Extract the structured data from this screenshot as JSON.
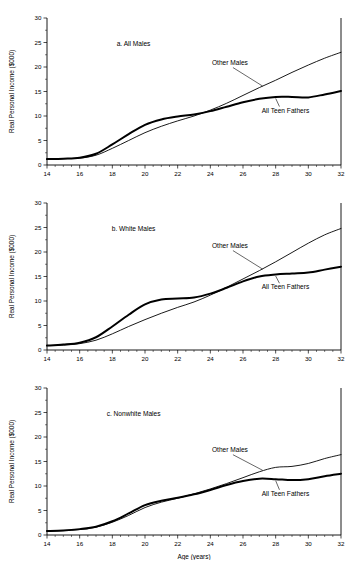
{
  "figure": {
    "xlabel": "Age (years)",
    "ylabel": "Real Personal Income ($000)",
    "x_ticks": [
      "14",
      "16",
      "18",
      "20",
      "22",
      "24",
      "26",
      "28",
      "30",
      "32"
    ],
    "y_ticks": [
      "0",
      "5",
      "10",
      "15",
      "20",
      "25",
      "30"
    ],
    "line_color": "#000000",
    "background": "#ffffff"
  },
  "chart_data": [
    {
      "type": "line",
      "panel_id": "a",
      "title": "a. All Males",
      "xlabel": "",
      "ylabel": "Real Personal Income ($000)",
      "xlim": [
        14,
        32
      ],
      "ylim": [
        0,
        30
      ],
      "xticks": [
        14,
        16,
        18,
        20,
        22,
        24,
        26,
        28,
        30,
        32
      ],
      "yticks": [
        0,
        5,
        10,
        15,
        20,
        25,
        30
      ],
      "grid": false,
      "legend": "inline-annotations",
      "x": [
        14,
        15,
        16,
        17,
        18,
        19,
        20,
        21,
        22,
        23,
        24,
        25,
        26,
        27,
        28,
        29,
        30,
        31,
        32
      ],
      "series": [
        {
          "name": "All Teen Fathers",
          "style": "thick",
          "values": [
            1.2,
            1.3,
            1.5,
            2.3,
            4.2,
            6.3,
            8.2,
            9.3,
            9.9,
            10.3,
            11.0,
            11.9,
            12.8,
            13.5,
            13.9,
            13.9,
            13.8,
            14.4,
            15.1
          ]
        },
        {
          "name": "Other Males",
          "style": "thin",
          "values": [
            1.2,
            1.3,
            1.4,
            2.0,
            3.4,
            5.0,
            6.6,
            7.9,
            9.0,
            10.0,
            11.2,
            12.6,
            14.2,
            15.8,
            17.3,
            18.9,
            20.4,
            21.8,
            23.0
          ]
        }
      ]
    },
    {
      "type": "line",
      "panel_id": "b",
      "title": "b. White Males",
      "xlabel": "",
      "ylabel": "Real Personal Income ($000)",
      "xlim": [
        14,
        32
      ],
      "ylim": [
        0,
        30
      ],
      "xticks": [
        14,
        16,
        18,
        20,
        22,
        24,
        26,
        28,
        30,
        32
      ],
      "yticks": [
        0,
        5,
        10,
        15,
        20,
        25,
        30
      ],
      "grid": false,
      "legend": "inline-annotations",
      "x": [
        14,
        15,
        16,
        17,
        18,
        19,
        20,
        21,
        22,
        23,
        24,
        25,
        26,
        27,
        28,
        29,
        30,
        31,
        32
      ],
      "series": [
        {
          "name": "All Teen Fathers",
          "style": "thick",
          "values": [
            0.9,
            1.1,
            1.5,
            2.6,
            4.8,
            7.2,
            9.3,
            10.3,
            10.5,
            10.7,
            11.5,
            12.7,
            14.0,
            15.0,
            15.4,
            15.6,
            15.8,
            16.4,
            17.0
          ]
        },
        {
          "name": "Other Males",
          "style": "thin",
          "values": [
            0.9,
            1.0,
            1.3,
            2.0,
            3.3,
            4.8,
            6.2,
            7.5,
            8.7,
            9.8,
            11.2,
            12.8,
            14.5,
            16.2,
            18.0,
            19.9,
            21.8,
            23.5,
            24.8
          ]
        }
      ]
    },
    {
      "type": "line",
      "panel_id": "c",
      "title": "c. Nonwhite Males",
      "xlabel": "Age (years)",
      "ylabel": "Real Personal Income ($000)",
      "xlim": [
        14,
        32
      ],
      "ylim": [
        0,
        30
      ],
      "xticks": [
        14,
        16,
        18,
        20,
        22,
        24,
        26,
        28,
        30,
        32
      ],
      "yticks": [
        0,
        5,
        10,
        15,
        20,
        25,
        30
      ],
      "grid": false,
      "legend": "inline-annotations",
      "x": [
        14,
        15,
        16,
        17,
        18,
        19,
        20,
        21,
        22,
        23,
        24,
        25,
        26,
        27,
        28,
        29,
        30,
        31,
        32
      ],
      "series": [
        {
          "name": "All Teen Fathers",
          "style": "thick",
          "values": [
            0.8,
            0.9,
            1.2,
            1.7,
            2.8,
            4.4,
            6.1,
            7.0,
            7.6,
            8.3,
            9.2,
            10.2,
            11.0,
            11.5,
            11.4,
            11.2,
            11.4,
            12.0,
            12.5
          ]
        },
        {
          "name": "Other Males",
          "style": "thin",
          "values": [
            0.8,
            0.9,
            1.1,
            1.6,
            2.6,
            4.0,
            5.6,
            6.7,
            7.5,
            8.4,
            9.4,
            10.5,
            11.7,
            12.9,
            13.8,
            14.0,
            14.6,
            15.6,
            16.4
          ]
        }
      ]
    }
  ],
  "annotations": {
    "other_males": "Other Males",
    "teen_fathers": "All Teen Fathers"
  }
}
